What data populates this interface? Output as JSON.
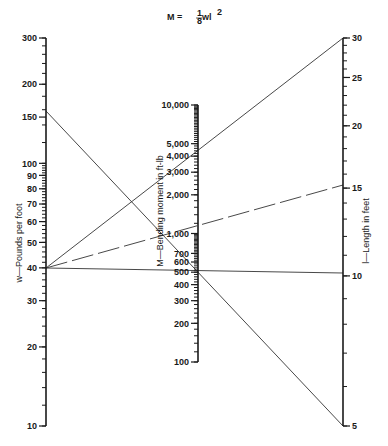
{
  "chart_data": {
    "type": "nomogram",
    "formula": {
      "lhs": "M = ",
      "frac_num": "1",
      "frac_den": "8",
      "rhs": " wl",
      "sup": "2"
    },
    "axes": [
      {
        "id": "w",
        "label": "w—Pounds per foot",
        "scale": "log",
        "range": [
          10,
          300
        ],
        "major_ticks": [
          10,
          20,
          30,
          40,
          50,
          60,
          70,
          80,
          90,
          100,
          150,
          200,
          300
        ],
        "tick_labels": [
          "10",
          "20",
          "30",
          "40",
          "50",
          "60",
          "70",
          "80",
          "90",
          "100",
          "150",
          "200",
          "300"
        ]
      },
      {
        "id": "M",
        "label": "M—Bending moment in ft-lb",
        "scale": "log",
        "range": [
          100,
          10000
        ],
        "major_ticks": [
          100,
          200,
          300,
          400,
          500,
          600,
          700,
          1000,
          2000,
          3000,
          4000,
          5000,
          10000
        ],
        "tick_labels": [
          "100",
          "200",
          "300",
          "400",
          "500",
          "600",
          "700",
          "1,000",
          "2,000",
          "3,000",
          "4,000",
          "5,000",
          "10,000"
        ]
      },
      {
        "id": "l",
        "label": "l—Length in feet",
        "scale": "log",
        "range": [
          5,
          30
        ],
        "major_ticks": [
          5,
          10,
          15,
          20,
          25,
          30
        ],
        "tick_labels": [
          "5",
          "10",
          "15",
          "20",
          "25",
          "30"
        ]
      }
    ],
    "isopleths": [
      {
        "w": 150,
        "l": 5,
        "M": 470,
        "style": "solid"
      },
      {
        "w": 40,
        "l": 30,
        "M": 4500,
        "style": "solid"
      },
      {
        "w": 40,
        "l": 15,
        "M": 1125,
        "style": "dashed"
      },
      {
        "w": 40,
        "l": 10,
        "M": 500,
        "style": "solid"
      }
    ],
    "grid": false,
    "legend": "none"
  },
  "colors": {
    "ink": "#1a1a1a",
    "line": "#333333",
    "background": "#ffffff"
  }
}
